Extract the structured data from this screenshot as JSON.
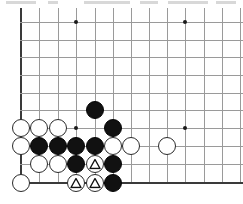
{
  "board": {
    "title": "Go board diagram",
    "type": "go-board-diagram",
    "background_color": "#ffffff",
    "grid_color": "#9a9a9a",
    "edge_color": "#3a3a3a",
    "black_color": "#111111",
    "white_color": "#ffffff",
    "geometry": {
      "cols_x": [
        21,
        39,
        58,
        76,
        95,
        113,
        131,
        149,
        167,
        185,
        204,
        222,
        240
      ],
      "rows_y": [
        22,
        40,
        57,
        75,
        93,
        110,
        128,
        146,
        164,
        183
      ],
      "left_edge_index": 0,
      "bottom_edge_index": 9,
      "stone_diameter": 18
    },
    "star_points": [
      {
        "col": 3,
        "row": 0
      },
      {
        "col": 9,
        "row": 0
      },
      {
        "col": 3,
        "row": 6
      },
      {
        "col": 9,
        "row": 6
      }
    ],
    "stones": [
      {
        "color": "black",
        "col": 4,
        "row": 5,
        "mark": ""
      },
      {
        "color": "black",
        "col": 5,
        "row": 6,
        "mark": ""
      },
      {
        "color": "white",
        "col": 0,
        "row": 6,
        "mark": ""
      },
      {
        "color": "white",
        "col": 1,
        "row": 6,
        "mark": ""
      },
      {
        "color": "white",
        "col": 2,
        "row": 6,
        "mark": ""
      },
      {
        "color": "white",
        "col": 0,
        "row": 7,
        "mark": ""
      },
      {
        "color": "black",
        "col": 1,
        "row": 7,
        "mark": ""
      },
      {
        "color": "black",
        "col": 2,
        "row": 7,
        "mark": ""
      },
      {
        "color": "black",
        "col": 3,
        "row": 7,
        "mark": ""
      },
      {
        "color": "black",
        "col": 4,
        "row": 7,
        "mark": ""
      },
      {
        "color": "white",
        "col": 5,
        "row": 7,
        "mark": ""
      },
      {
        "color": "white",
        "col": 6,
        "row": 7,
        "mark": ""
      },
      {
        "color": "white",
        "col": 8,
        "row": 7,
        "mark": ""
      },
      {
        "color": "white",
        "col": 1,
        "row": 8,
        "mark": ""
      },
      {
        "color": "white",
        "col": 2,
        "row": 8,
        "mark": ""
      },
      {
        "color": "black",
        "col": 3,
        "row": 8,
        "mark": ""
      },
      {
        "color": "white",
        "col": 4,
        "row": 8,
        "mark": "triangle"
      },
      {
        "color": "black",
        "col": 5,
        "row": 8,
        "mark": ""
      },
      {
        "color": "white",
        "col": 0,
        "row": 9,
        "mark": ""
      },
      {
        "color": "white",
        "col": 3,
        "row": 9,
        "mark": "triangle"
      },
      {
        "color": "white",
        "col": 4,
        "row": 9,
        "mark": "triangle"
      },
      {
        "color": "black",
        "col": 5,
        "row": 9,
        "mark": ""
      }
    ],
    "marks_legend": {
      "triangle": "triangle-marked-white-stone",
      "triangle_count": 3
    },
    "counts": {
      "black_stones": 9,
      "white_stones": 13,
      "total_stones": 22
    }
  }
}
